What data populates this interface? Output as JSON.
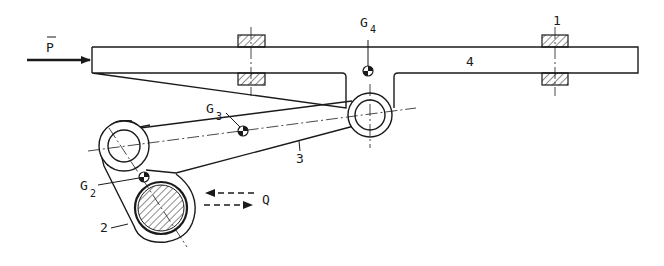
{
  "diagram": {
    "type": "mechanism-linkage",
    "force_input": {
      "symbol": "P",
      "overbar": true
    },
    "force_output": {
      "symbol": "Q",
      "direction": "bidirectional-horizontal"
    },
    "parts": [
      {
        "id": "1",
        "label": "1",
        "description": "frame / guide bearings"
      },
      {
        "id": "2",
        "label": "2",
        "description": "crank"
      },
      {
        "id": "3",
        "label": "3",
        "description": "connecting rod"
      },
      {
        "id": "4",
        "label": "4",
        "description": "slider bar"
      }
    ],
    "centers_of_mass": [
      {
        "letter": "G",
        "index": "2"
      },
      {
        "letter": "G",
        "index": "3"
      },
      {
        "letter": "G",
        "index": "4"
      }
    ]
  }
}
